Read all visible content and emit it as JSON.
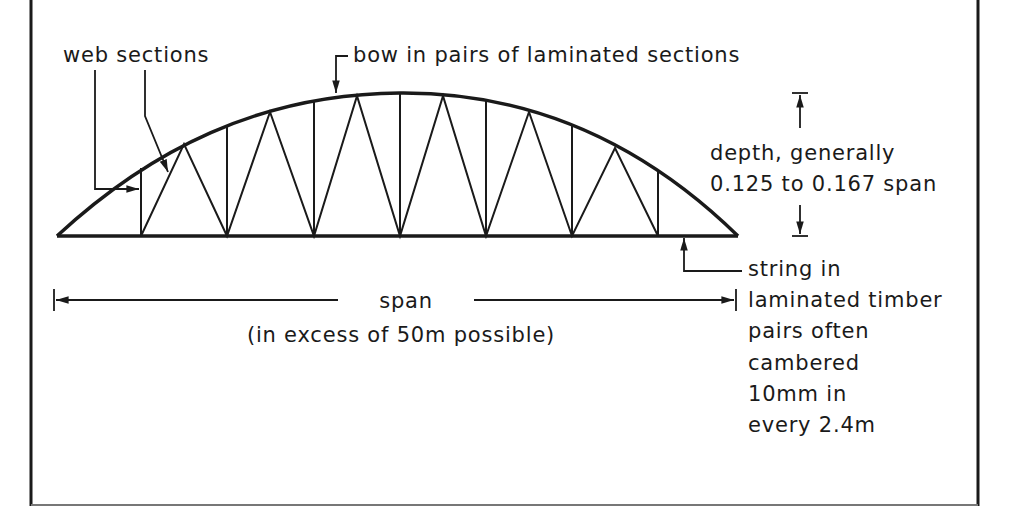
{
  "diagram": {
    "labels": {
      "web_sections": "web sections",
      "bow": "bow in pairs of laminated sections",
      "depth_line1": "depth, generally",
      "depth_line2": "0.125 to 0.167 span",
      "span": "span",
      "span_note": "(in excess of 50m possible)",
      "string_lines": [
        "string in",
        "laminated timber",
        "pairs often",
        "cambered",
        "10mm in",
        "every 2.4m"
      ]
    },
    "geometry": {
      "frame": {
        "left": 31,
        "right": 978,
        "bottom": 505
      },
      "bottom_chord": {
        "x1": 57,
        "x2": 738,
        "y": 236
      },
      "apex": {
        "x": 400,
        "y": 93
      },
      "panel_points_x": [
        141,
        227,
        314,
        400,
        486,
        572,
        658
      ],
      "diagonal_apex_x": [
        184,
        270,
        357,
        443,
        529,
        615
      ]
    },
    "colors": {
      "line": "#1a1a1a",
      "background": "#ffffff"
    }
  }
}
